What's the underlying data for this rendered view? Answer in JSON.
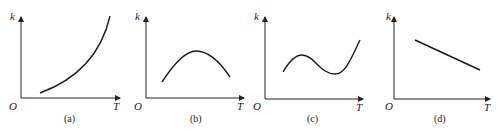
{
  "figure": {
    "panels": [
      {
        "id": "a",
        "caption": "(a)",
        "y_label": "k",
        "x_label": "T",
        "origin_label": "O",
        "shape": "increasing exponential-like curve"
      },
      {
        "id": "b",
        "caption": "(b)",
        "y_label": "k",
        "x_label": "T",
        "origin_label": "O",
        "shape": "single maximum (hump)"
      },
      {
        "id": "c",
        "caption": "(c)",
        "y_label": "k",
        "x_label": "T",
        "origin_label": "O",
        "shape": "rise, fall to minimum, then rise"
      },
      {
        "id": "d",
        "caption": "(d)",
        "y_label": "k",
        "x_label": "T",
        "origin_label": "O",
        "shape": "linear decreasing"
      }
    ]
  }
}
